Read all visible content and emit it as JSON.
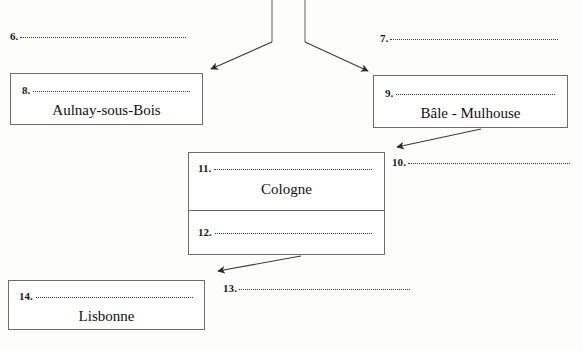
{
  "diagram": {
    "type": "fill-in-the-blank flow diagram",
    "blanks": [
      {
        "id": "6",
        "number": "6.",
        "answer": ""
      },
      {
        "id": "7",
        "number": "7.",
        "answer": ""
      },
      {
        "id": "10",
        "number": "10.",
        "answer": ""
      },
      {
        "id": "13",
        "number": "13.",
        "answer": ""
      }
    ],
    "boxes": [
      {
        "id": "box-8",
        "number": "8.",
        "city": "Aulnay-sous-Bois"
      },
      {
        "id": "box-9",
        "number": "9.",
        "city": "Bâle - Mulhouse"
      },
      {
        "id": "box-11",
        "number": "11.",
        "city": "Cologne"
      },
      {
        "id": "box-12",
        "number": "12.",
        "city": ""
      },
      {
        "id": "box-14",
        "number": "14.",
        "city": "Lisbonne"
      }
    ],
    "colors": {
      "ink": "#1a1a1a",
      "box_border": "#6c6c6c",
      "dotted_rule": "#3a3a3a",
      "arrow": "#2b2b2b",
      "page": "#fdfdfc"
    }
  }
}
